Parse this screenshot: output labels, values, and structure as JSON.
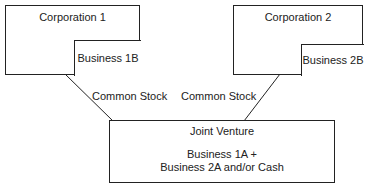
{
  "corporation1": {
    "title": "Corporation 1",
    "business": "Business 1B"
  },
  "corporation2": {
    "title": "Corporation 2",
    "business": "Business 2B"
  },
  "edges": [
    {
      "label": "Common Stock"
    },
    {
      "label": "Common Stock"
    }
  ],
  "joint_venture": {
    "title": "Joint Venture",
    "line1": "Business 1A +",
    "line2": "Business 2A and/or Cash"
  }
}
